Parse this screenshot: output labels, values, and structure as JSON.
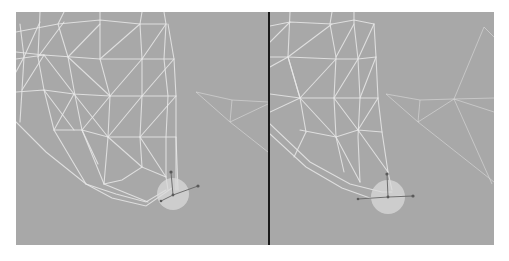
{
  "figure": {
    "background_color": "#a8a8a8",
    "wire_color": "#e8e8e8",
    "divider_color": "#1a1a1a",
    "panels": [
      {
        "id": "left",
        "label": ""
      },
      {
        "id": "right",
        "label": ""
      }
    ]
  }
}
